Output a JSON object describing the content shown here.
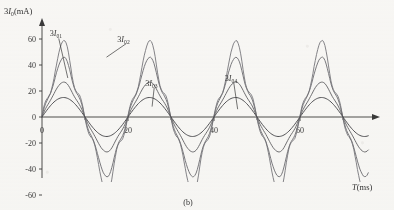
{
  "figure": {
    "caption": "(b)",
    "background_color": "#fbfbfa",
    "ink_color": "#3a3a3a",
    "curve_color": "#6e6e72"
  },
  "chart_data": {
    "type": "line",
    "title": "",
    "subtitle": "",
    "xlabel": "T(ms)",
    "ylabel": "3I₀(mA)",
    "xlim": [
      0,
      74
    ],
    "ylim": [
      -68,
      70
    ],
    "xticks": [
      0,
      20,
      40,
      60
    ],
    "xticklabels": [
      "0",
      "20",
      "40",
      "60"
    ],
    "xminorticks": [
      10,
      30,
      50,
      70
    ],
    "yticks": [
      60,
      40,
      20,
      0,
      -20,
      -40,
      -60
    ],
    "yticklabels": [
      "60",
      "40",
      "20",
      "0",
      "-20",
      "-40",
      "-60"
    ],
    "grid": false,
    "legend": "inline-annotations",
    "period_ms": 20,
    "phase_deg": 0,
    "annotations": [
      {
        "label": "3I₀₁",
        "text": "3I01",
        "x_ms": 1.8,
        "y_ma": 62,
        "points_to_x_ms": 6.0,
        "points_to_y_ma": 30
      },
      {
        "label": "3I₀₂",
        "text": "3I02",
        "x_ms": 17.5,
        "y_ma": 58,
        "points_to_x_ms": 15.0,
        "points_to_y_ma": 46
      },
      {
        "label": "3I₀₃",
        "text": "3I03",
        "x_ms": 24.0,
        "y_ma": 24,
        "points_to_x_ms": 25.6,
        "points_to_y_ma": 8
      },
      {
        "label": "3I₀₄",
        "text": "3I04",
        "x_ms": 42.5,
        "y_ma": 28,
        "points_to_x_ms": 45.5,
        "points_to_y_ma": 6
      }
    ],
    "series": [
      {
        "name": "3I01",
        "amplitude_ma": 15,
        "harmonic_distortion": 0.0,
        "color": "#4b4b4f",
        "linewidth": 1.0,
        "description": "smallest amplitude, nearly pure sinusoid, peak ~+15 mA, trough ~-13 mA"
      },
      {
        "name": "3I02",
        "amplitude_ma": 25,
        "harmonic_distortion": 0.1,
        "color": "#6a6a6e",
        "linewidth": 1.0,
        "description": "peak ~+25 mA, trough ~-24 mA, slightly flattened crest"
      },
      {
        "name": "3I03",
        "amplitude_ma": 40,
        "harmonic_distortion": 0.2,
        "color": "#75757a",
        "linewidth": 1.0,
        "description": "peak ~+40 mA, trough ~-40 mA, notched crest and trough"
      },
      {
        "name": "3I04",
        "amplitude_ma": 48,
        "harmonic_distortion": 0.3,
        "color": "#808085",
        "linewidth": 1.0,
        "description": "largest amplitude, peak ~+48 mA, trough ~-50 mA, strongly notched / double-humped peaks"
      }
    ]
  }
}
